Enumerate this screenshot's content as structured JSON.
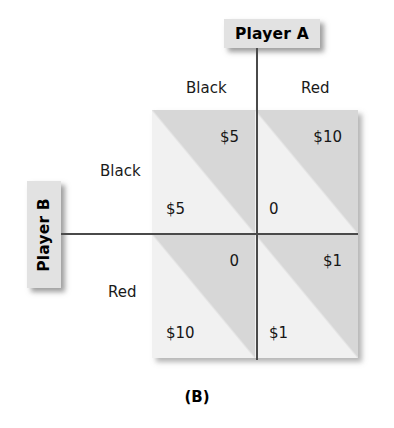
{
  "figure": {
    "caption": "(B)",
    "column_player": {
      "name": "Player A",
      "categories": [
        "Black",
        "Red"
      ]
    },
    "row_player": {
      "name": "Player B",
      "categories": [
        "Black",
        "Red"
      ]
    },
    "colors": {
      "player_a_triangle": "#d7d7d7",
      "player_b_triangle": "#f1f1f1",
      "label_box": "#e2e2e2",
      "line": "#4a4a4a",
      "text": "#161616"
    }
  },
  "chart_data": {
    "type": "table",
    "title": "(B)",
    "xlabel": "Player A",
    "ylabel": "Player B",
    "categories": [
      "Black",
      "Red"
    ],
    "row_categories": [
      "Black",
      "Red"
    ],
    "column_categories": [
      "Black",
      "Red"
    ],
    "cells": [
      {
        "row": "Black",
        "column": "Black",
        "player_a_payoff": "$5",
        "player_b_payoff": "$5"
      },
      {
        "row": "Black",
        "column": "Red",
        "player_a_payoff": "$10",
        "player_b_payoff": "0"
      },
      {
        "row": "Red",
        "column": "Black",
        "player_a_payoff": "0",
        "player_b_payoff": "$10"
      },
      {
        "row": "Red",
        "column": "Red",
        "player_a_payoff": "$1",
        "player_b_payoff": "$1"
      }
    ]
  }
}
